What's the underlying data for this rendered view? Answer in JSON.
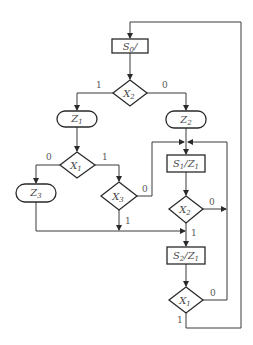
{
  "diagram": {
    "type": "ASM chart",
    "states": [
      {
        "id": "s0",
        "name": "S",
        "sub": "0",
        "output": "/"
      },
      {
        "id": "s1",
        "name": "S",
        "sub": "1",
        "output": "/Z",
        "output_sub": "1"
      },
      {
        "id": "s2",
        "name": "S",
        "sub": "2",
        "output": "/Z",
        "output_sub": "1"
      }
    ],
    "conditional_outputs": [
      {
        "id": "z1",
        "name": "Z",
        "sub": "1"
      },
      {
        "id": "z2",
        "name": "Z",
        "sub": "2"
      },
      {
        "id": "z3",
        "name": "Z",
        "sub": "3"
      }
    ],
    "decisions": [
      {
        "id": "d_x2_top",
        "name": "X",
        "sub": "2",
        "true_label": "1",
        "false_label": "0"
      },
      {
        "id": "d_x1_left",
        "name": "X",
        "sub": "1",
        "true_label": "1",
        "false_label": "0"
      },
      {
        "id": "d_x3",
        "name": "X",
        "sub": "3",
        "true_label": "1",
        "false_label": "0"
      },
      {
        "id": "d_x2_mid",
        "name": "X",
        "sub": "2",
        "true_label": "1",
        "false_label": "0"
      },
      {
        "id": "d_x1_bottom",
        "name": "X",
        "sub": "1",
        "true_label": "1",
        "false_label": "0"
      }
    ],
    "colors": {
      "stroke": "#2a2a2a",
      "text": "#4a4a4a",
      "background": "#ffffff"
    }
  }
}
